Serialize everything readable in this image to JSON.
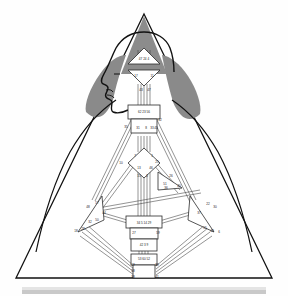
{
  "diagram": {
    "type": "bodygraph",
    "colors": {
      "crown_triangle": "#8c8c8c",
      "hair_shading": "#8a8a8a",
      "outline": "#111111",
      "channel_stroke": "#3a3a3a",
      "center_fill": "#ffffff",
      "background": "#fefefe",
      "bottom_bar": "#c9c9c9",
      "bottom_bar_light": "#e4e4e4"
    },
    "frame": {
      "shape": "triangle",
      "apex_x": 144,
      "apex_y": 14,
      "base_left_x": 16,
      "base_right_x": 272,
      "base_y": 278
    },
    "bottom_bar": {
      "x": 22,
      "y": 288,
      "width": 244,
      "height": 5
    },
    "centers": [
      {
        "name": "head",
        "shape": "triangle-up",
        "cx": 144,
        "cy": 60,
        "gates": "47 24 4"
      },
      {
        "name": "ajna",
        "shape": "triangle-down",
        "cx": 144,
        "cy": 78,
        "gates": "17 11"
      },
      {
        "name": "ajna-lower",
        "shape": "square",
        "cx": 144,
        "cy": 92,
        "gates": "43 47"
      },
      {
        "name": "throat",
        "shape": "square",
        "cx": 144,
        "cy": 113,
        "gates": "62 23 56"
      },
      {
        "name": "throat-lower",
        "shape": "square",
        "cx": 144,
        "cy": 131,
        "gates": "35 12 45"
      },
      {
        "name": "g-center",
        "shape": "diamond",
        "cx": 144,
        "cy": 161,
        "gates": "7 1 13"
      },
      {
        "name": "heart-ego",
        "shape": "triangle",
        "cx": 166,
        "cy": 178,
        "gates": "26 40 51"
      },
      {
        "name": "spleen",
        "shape": "triangle",
        "cx": 96,
        "cy": 205,
        "gates": "48 57 44 50 32 28 18"
      },
      {
        "name": "solar-plexus",
        "shape": "triangle",
        "cx": 196,
        "cy": 205,
        "gates": "36 22 37 30 55 49 6"
      },
      {
        "name": "sacral",
        "shape": "square",
        "cx": 144,
        "cy": 222,
        "gates": "34 5 14 29"
      },
      {
        "name": "sacral-lower",
        "shape": "square",
        "cx": 144,
        "cy": 233,
        "gates": "27 59"
      },
      {
        "name": "root",
        "shape": "square",
        "cx": 144,
        "cy": 245,
        "gates": "42 3 9"
      },
      {
        "name": "root-lower",
        "shape": "square",
        "cx": 144,
        "cy": 259,
        "gates": "53 60 52"
      },
      {
        "name": "root-base",
        "shape": "square",
        "cx": 144,
        "cy": 272,
        "gates": "19 39 41 58 38"
      }
    ],
    "gate_labels": [
      {
        "id": "g-47-24-4",
        "text": "47 24 4",
        "x": 144,
        "y": 59
      },
      {
        "id": "g-17",
        "text": "17",
        "x": 136,
        "y": 76
      },
      {
        "id": "g-11",
        "text": "11",
        "x": 152,
        "y": 76
      },
      {
        "id": "g-43",
        "text": "43",
        "x": 141,
        "y": 90
      },
      {
        "id": "g-47b",
        "text": "47",
        "x": 149,
        "y": 90
      },
      {
        "id": "g-62-23-56",
        "text": "62 23 56",
        "x": 144,
        "y": 112
      },
      {
        "id": "g-35",
        "text": "35",
        "x": 126,
        "y": 127
      },
      {
        "id": "g-12",
        "text": "12",
        "x": 160,
        "y": 120
      },
      {
        "id": "g-45",
        "text": "45",
        "x": 156,
        "y": 128
      },
      {
        "id": "g-31",
        "text": "31",
        "x": 138,
        "y": 128
      },
      {
        "id": "g-8",
        "text": "8",
        "x": 146,
        "y": 128
      },
      {
        "id": "g-33",
        "text": "33",
        "x": 152,
        "y": 128
      },
      {
        "id": "g-7",
        "text": "7",
        "x": 135,
        "y": 156
      },
      {
        "id": "g-1",
        "text": "1",
        "x": 152,
        "y": 156
      },
      {
        "id": "g-10",
        "text": "10",
        "x": 121,
        "y": 163
      },
      {
        "id": "g-13",
        "text": "13",
        "x": 139,
        "y": 168
      },
      {
        "id": "g-25",
        "text": "25",
        "x": 157,
        "y": 162
      },
      {
        "id": "g-46",
        "text": "46",
        "x": 151,
        "y": 168
      },
      {
        "id": "g-15",
        "text": "15",
        "x": 139,
        "y": 176
      },
      {
        "id": "g-2",
        "text": "2",
        "x": 147,
        "y": 176
      },
      {
        "id": "g-26",
        "text": "26",
        "x": 171,
        "y": 176
      },
      {
        "id": "g-51",
        "text": "51",
        "x": 165,
        "y": 184
      },
      {
        "id": "g-40",
        "text": "40",
        "x": 179,
        "y": 186
      },
      {
        "id": "g-36",
        "text": "36",
        "x": 166,
        "y": 188
      },
      {
        "id": "g-48",
        "text": "48",
        "x": 88,
        "y": 207
      },
      {
        "id": "g-57",
        "text": "57",
        "x": 97,
        "y": 203
      },
      {
        "id": "g-44",
        "text": "44",
        "x": 104,
        "y": 213
      },
      {
        "id": "g-50",
        "text": "50",
        "x": 97,
        "y": 220
      },
      {
        "id": "g-32",
        "text": "32",
        "x": 90,
        "y": 222
      },
      {
        "id": "g-28",
        "text": "28",
        "x": 83,
        "y": 229
      },
      {
        "id": "g-18",
        "text": "18",
        "x": 76,
        "y": 231
      },
      {
        "id": "g-22",
        "text": "22",
        "x": 208,
        "y": 204
      },
      {
        "id": "g-30",
        "text": "30",
        "x": 215,
        "y": 207
      },
      {
        "id": "g-37",
        "text": "37",
        "x": 199,
        "y": 213
      },
      {
        "id": "g-55",
        "text": "55",
        "x": 205,
        "y": 228
      },
      {
        "id": "g-49",
        "text": "49",
        "x": 212,
        "y": 231
      },
      {
        "id": "g-6",
        "text": "6",
        "x": 219,
        "y": 232
      },
      {
        "id": "g-34-5-14-29",
        "text": "34 5 14 29",
        "x": 144,
        "y": 223
      },
      {
        "id": "g-27",
        "text": "27",
        "x": 134,
        "y": 233
      },
      {
        "id": "g-59",
        "text": "59",
        "x": 158,
        "y": 233
      },
      {
        "id": "g-42-3-9",
        "text": "42 3 9",
        "x": 144,
        "y": 245
      },
      {
        "id": "g-53-60-52",
        "text": "53 60 52",
        "x": 144,
        "y": 259
      },
      {
        "id": "g-19",
        "text": "19",
        "x": 133,
        "y": 265
      },
      {
        "id": "g-39",
        "text": "39",
        "x": 157,
        "y": 265
      },
      {
        "id": "g-58",
        "text": "58",
        "x": 133,
        "y": 271
      },
      {
        "id": "g-38",
        "text": "38",
        "x": 133,
        "y": 277
      },
      {
        "id": "g-41",
        "text": "41",
        "x": 157,
        "y": 277
      }
    ],
    "figure": {
      "head_profile": "left-facing human head with nose, lips and chin",
      "hair_left": "gray triangular hair mass on left",
      "hair_right": "gray triangular hair mass on right",
      "crown": "gray upward triangle above head"
    }
  }
}
